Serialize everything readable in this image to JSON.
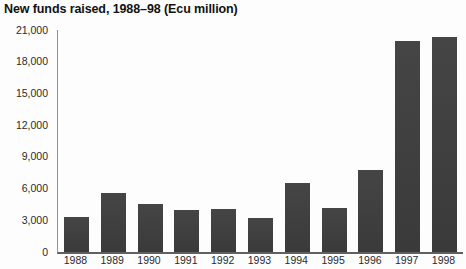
{
  "chart_data": {
    "type": "bar",
    "title": "New funds raised, 1988–98 (Ecu million)",
    "categories": [
      "1988",
      "1989",
      "1990",
      "1991",
      "1992",
      "1993",
      "1994",
      "1995",
      "1996",
      "1997",
      "1998"
    ],
    "values": [
      3300,
      5600,
      4500,
      4000,
      4100,
      3200,
      6500,
      4200,
      7800,
      20000,
      20300
    ],
    "xlabel": "",
    "ylabel": "",
    "ylim": [
      0,
      21000
    ],
    "ytick_step": 3000,
    "ytick_labels": [
      "0",
      "3,000",
      "6,000",
      "9,000",
      "12,000",
      "15,000",
      "18,000",
      "21,000"
    ],
    "grid": false,
    "legend": "none",
    "bar_color": "#3d3d3d"
  },
  "colors": {
    "bar": "#3d3d3d",
    "y_axis_line": "#919191",
    "baseline": "#606060",
    "text": "#2a2a2a",
    "title_text": "#111111",
    "background": "#fdfdfd"
  }
}
